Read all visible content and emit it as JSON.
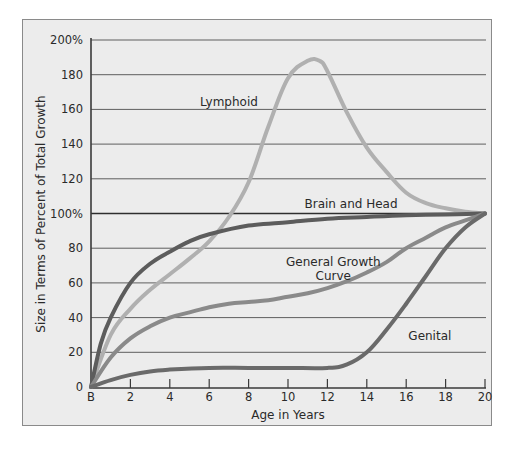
{
  "chart_data": {
    "type": "line",
    "title": "",
    "xlabel": "Age in Years",
    "ylabel": "Size in Terms of Percent of Total Growth",
    "x_ticks": [
      {
        "value": 0,
        "label": "B"
      },
      {
        "value": 2,
        "label": "2"
      },
      {
        "value": 4,
        "label": "4"
      },
      {
        "value": 6,
        "label": "6"
      },
      {
        "value": 8,
        "label": "8"
      },
      {
        "value": 10,
        "label": "10"
      },
      {
        "value": 12,
        "label": "12"
      },
      {
        "value": 14,
        "label": "14"
      },
      {
        "value": 16,
        "label": "16"
      },
      {
        "value": 18,
        "label": "18"
      },
      {
        "value": 20,
        "label": "20"
      }
    ],
    "y_ticks": [
      {
        "value": 0,
        "label": "0"
      },
      {
        "value": 20,
        "label": "20"
      },
      {
        "value": 40,
        "label": "40"
      },
      {
        "value": 60,
        "label": "60"
      },
      {
        "value": 80,
        "label": "80"
      },
      {
        "value": 100,
        "label": "100%"
      },
      {
        "value": 120,
        "label": "120"
      },
      {
        "value": 140,
        "label": "140"
      },
      {
        "value": 160,
        "label": "160"
      },
      {
        "value": 180,
        "label": "180"
      },
      {
        "value": 200,
        "label": "200%"
      }
    ],
    "xlim": [
      0,
      20
    ],
    "ylim": [
      0,
      200
    ],
    "grid": {
      "horizontal": true,
      "vertical": false,
      "emphasized_line": 100
    },
    "legend": "none (curves labeled inline)",
    "series": [
      {
        "name": "Lymphoid",
        "label": "Lymphoid",
        "color": "#b0b0b0",
        "label_pos": {
          "x": 7.0,
          "y": 162
        },
        "x": [
          0,
          1,
          2,
          3,
          4,
          5,
          6,
          7,
          8,
          9,
          10,
          11,
          11.6,
          12,
          13,
          14,
          15,
          16,
          17,
          18,
          19,
          20
        ],
        "values": [
          0,
          30,
          45,
          56,
          65,
          74,
          84,
          98,
          118,
          150,
          178,
          188,
          188,
          182,
          158,
          138,
          124,
          112,
          106,
          103,
          101,
          100
        ]
      },
      {
        "name": "Brain and Head",
        "label": "Brain and Head",
        "color": "#5c5c5c",
        "label_pos": {
          "x": 13.2,
          "y": 103
        },
        "x": [
          0,
          0.5,
          1,
          2,
          3,
          4,
          5,
          6,
          8,
          10,
          12,
          14,
          16,
          18,
          20
        ],
        "values": [
          0,
          25,
          40,
          60,
          71,
          78,
          84,
          88,
          93,
          95,
          97,
          98,
          99,
          99.5,
          100
        ]
      },
      {
        "name": "General Growth Curve",
        "label": "General Growth\nCurve",
        "color": "#8a8a8a",
        "label_pos": {
          "x": 12.3,
          "y": 70
        },
        "x": [
          0,
          1,
          2,
          3,
          4,
          5,
          6,
          7,
          8,
          9,
          10,
          11,
          12,
          13,
          14,
          15,
          16,
          17,
          18,
          19,
          20
        ],
        "values": [
          0,
          17,
          28,
          35,
          40,
          43,
          46,
          48,
          49,
          50,
          52,
          54,
          57,
          61,
          66,
          72,
          80,
          86,
          92,
          96,
          100
        ]
      },
      {
        "name": "Genital",
        "label": "Genital",
        "color": "#6a6a6a",
        "label_pos": {
          "x": 17.2,
          "y": 27
        },
        "x": [
          0,
          1,
          2,
          3,
          4,
          6,
          8,
          10,
          12,
          13,
          14,
          15,
          16,
          17,
          18,
          19,
          20
        ],
        "values": [
          0,
          4,
          7,
          9,
          10,
          11,
          11,
          11,
          11,
          13,
          20,
          33,
          48,
          64,
          80,
          92,
          100
        ]
      }
    ]
  }
}
